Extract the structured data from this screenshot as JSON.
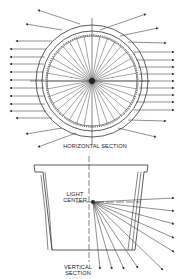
{
  "diagram": {
    "labels": {
      "horizontal_section": "HORIZONTAL SECTION",
      "light_center_line1": "LIGHT",
      "light_center_line2": "CENTER",
      "vertical_section_line1": "VERTICAL",
      "vertical_section_line2": "SECTION"
    },
    "colors": {
      "line": "#333333",
      "background": "#ffffff"
    }
  }
}
